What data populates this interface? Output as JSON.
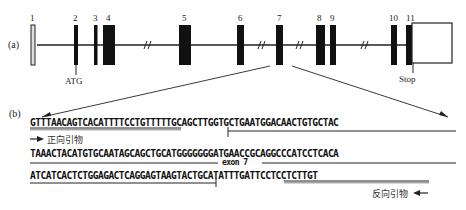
{
  "header_fragment": "...",
  "panel_a": {
    "label": "(a)",
    "exons": [
      {
        "number": "1",
        "x": 33,
        "w": 4,
        "type": "open"
      },
      {
        "number": "2",
        "x": 75,
        "w": 4,
        "type": "filled"
      },
      {
        "number": "3",
        "x": 93,
        "w": 4,
        "type": "filled"
      },
      {
        "number": "4",
        "x": 103,
        "w": 12,
        "type": "filled"
      },
      {
        "number": "5",
        "x": 179,
        "w": 12,
        "type": "filled"
      },
      {
        "number": "6",
        "x": 237,
        "w": 7,
        "type": "filled"
      },
      {
        "number": "7",
        "x": 276,
        "w": 7,
        "type": "filled"
      },
      {
        "number": "8",
        "x": 316,
        "w": 9,
        "type": "filled"
      },
      {
        "number": "9",
        "x": 330,
        "w": 6,
        "type": "filled"
      },
      {
        "number": "10",
        "x": 391,
        "w": 6,
        "type": "filled"
      },
      {
        "number": "11",
        "x": 406,
        "w": 6,
        "type": "filled"
      }
    ],
    "utr_box": {
      "x": 412,
      "y": 23,
      "w": 40,
      "h": 40
    },
    "breaks": [
      146,
      260,
      298,
      362
    ],
    "atg_label": "ATG",
    "stop_label": "Stop"
  },
  "panel_b": {
    "label": "(b)",
    "lines": [
      "GTTTAACAGTCACATTTTCCTGTTTTTGCAGCTTGGTGCTGAATGGACAACTGTGCTAC",
      "TAAACTACATGTGCAATAGCAGCTGCATGGGGGGGATGAACCGCAGGCCCATCCTCACA",
      "ATCATCACTCTGGAGACTCAGGAGTAAGTACTGCATATTTGATTCCTCCTCTTGT"
    ],
    "forward_primer_seq": "GTTTAACAGTCACATTTTCCT",
    "forward_primer_label": "正向引物",
    "reverse_primer_seq": "ATATTTGATTCCTCCTCTTGT",
    "reverse_primer_label": "反向引物",
    "exon_label": "exon 7"
  },
  "colors": {
    "ink": "#111111",
    "line": "#222222",
    "box_fill": "#ffffff",
    "exon1_fill": "#dddddd"
  }
}
